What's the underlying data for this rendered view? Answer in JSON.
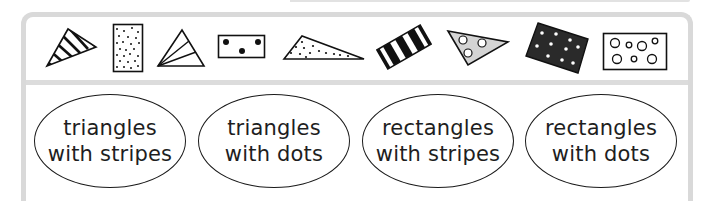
{
  "shapes": [
    {
      "id": "triangle-stripes",
      "kind": "triangle",
      "pattern": "diagonal stripes"
    },
    {
      "id": "rectangle-small-dots",
      "kind": "rectangle",
      "pattern": "many small dots"
    },
    {
      "id": "triangle-lines",
      "kind": "triangle",
      "pattern": "radiating lines"
    },
    {
      "id": "rectangle-three-dots",
      "kind": "rectangle",
      "pattern": "three large dots"
    },
    {
      "id": "triangle-small-dots",
      "kind": "triangle",
      "pattern": "small dots"
    },
    {
      "id": "rectangle-stripes",
      "kind": "rectangle",
      "pattern": "thick black stripes"
    },
    {
      "id": "triangle-circles",
      "kind": "triangle",
      "pattern": "grey fill with three circles"
    },
    {
      "id": "rectangle-black-white-dots",
      "kind": "rectangle",
      "pattern": "black fill with white dots"
    },
    {
      "id": "rectangle-circles",
      "kind": "rectangle",
      "pattern": "open circles"
    }
  ],
  "categories": [
    {
      "line1": "triangles",
      "line2": "with stripes"
    },
    {
      "line1": "triangles",
      "line2": "with dots"
    },
    {
      "line1": "rectangles",
      "line2": "with stripes"
    },
    {
      "line1": "rectangles",
      "line2": "with dots"
    }
  ],
  "colors": {
    "frame": "#d9d9d9",
    "ink": "#1a1a1a",
    "grey_fill": "#d4d4d4",
    "dark_fill": "#2a2a2a"
  }
}
